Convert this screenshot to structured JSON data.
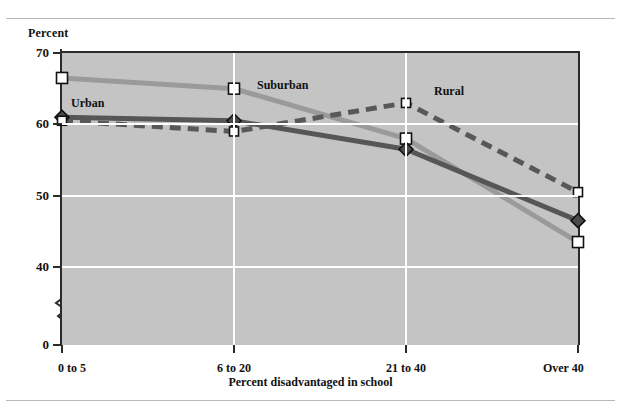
{
  "chart_data": {
    "type": "line",
    "title": "",
    "xlabel": "Percent disadvantaged in school",
    "ylabel": "Percent",
    "categories": [
      "0 to 5",
      "6 to 20",
      "21 to 40",
      "Over 40"
    ],
    "yticks": [
      0,
      40,
      50,
      60,
      70
    ],
    "ylim": [
      0,
      70
    ],
    "y_axis_break": true,
    "y_axis_break_between": [
      0,
      40
    ],
    "grid": "horizontal-and-vertical",
    "legend": "inline-labels",
    "series": [
      {
        "name": "Suburban",
        "values": [
          66.5,
          65.0,
          58.0,
          43.5
        ],
        "color": "#9a9a9a",
        "style": "solid",
        "marker": "open-square",
        "label_x": 257,
        "label_y": 78
      },
      {
        "name": "Urban",
        "values": [
          61.0,
          60.5,
          56.5,
          46.5
        ],
        "color": "#565656",
        "style": "solid",
        "marker": "filled-diamond",
        "label_x": 71,
        "label_y": 96
      },
      {
        "name": "Rural",
        "values": [
          60.5,
          59.0,
          63.0,
          50.5
        ],
        "color": "#585858",
        "style": "dashed",
        "marker": "small-open-square",
        "label_x": 434,
        "label_y": 84
      }
    ]
  },
  "axis": {
    "y_title": "Percent",
    "x_title": "Percent disadvantaged in school",
    "y_tick_labels": [
      "70",
      "60",
      "50",
      "40",
      "0"
    ],
    "x_tick_labels": [
      "0 to 5",
      "6 to 20",
      "21 to 40",
      "Over 40"
    ]
  },
  "ghost_title": ""
}
